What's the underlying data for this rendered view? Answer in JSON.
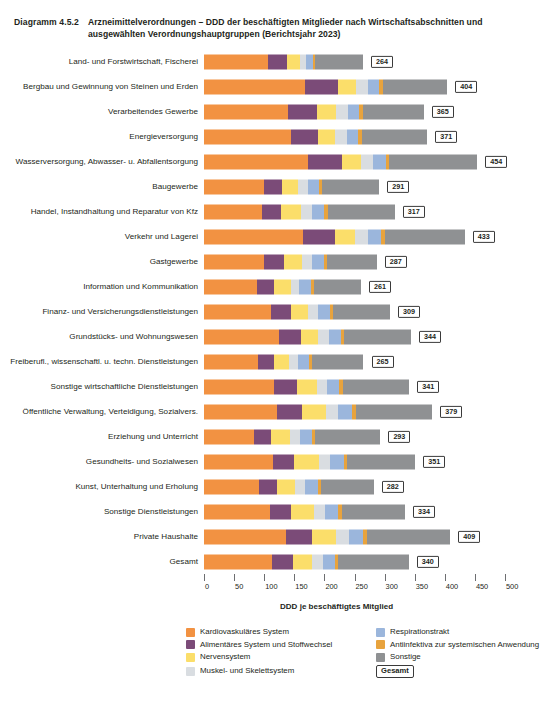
{
  "header": {
    "diagram_number": "Diagramm 4.5.2",
    "title": "Arzneimittelverordnungen – DDD der beschäftigten Mitglieder nach Wirtschaftsabschnitten und ausgewählten Verordnungshauptgruppen (Berichtsjahr 2023)"
  },
  "legend": {
    "total_label": "Gesamt"
  },
  "chart_data": {
    "type": "bar",
    "orientation": "horizontal",
    "stacked": true,
    "title": "Arzneimittelverordnungen – DDD der beschäftigten Mitglieder nach Wirtschaftsabschnitten und ausgewählten Verordnungshauptgruppen (Berichtsjahr 2023)",
    "xlabel": "DDD je beschäftigtes Mitglied",
    "ylabel": "",
    "xlim": [
      0,
      500
    ],
    "xticks": [
      0,
      50,
      100,
      150,
      200,
      250,
      300,
      350,
      400,
      450,
      500
    ],
    "grid": false,
    "legend_position": "bottom",
    "colors": {
      "Kardiovaskuläres System": "#F29242",
      "Alimentäres System und Stoffwechsel": "#7B4B78",
      "Nervensystem": "#FBDE6A",
      "Muskel- und Skelettsystem": "#D9DDE1",
      "Respirationstrakt": "#9BB6DC",
      "Antiinfektiva zur systemischen Anwendung": "#E8A33D",
      "Sonstige": "#8F9193"
    },
    "series": [
      {
        "name": "Kardiovaskuläres System",
        "color": "#F29242",
        "values": [
          106,
          168,
          140,
          145,
          172,
          100,
          96,
          165,
          100,
          88,
          111,
          124,
          89,
          117,
          122,
          83,
          114,
          92,
          110,
          137,
          113
        ]
      },
      {
        "name": "Alimentäres System und Stoffwechsel",
        "color": "#7B4B78",
        "values": [
          32,
          55,
          48,
          45,
          57,
          30,
          32,
          52,
          33,
          28,
          33,
          37,
          27,
          37,
          41,
          29,
          36,
          30,
          34,
          43,
          35
        ]
      },
      {
        "name": "Nervensystem",
        "color": "#FBDE6A",
        "values": [
          22,
          29,
          31,
          28,
          31,
          26,
          33,
          34,
          29,
          28,
          29,
          29,
          26,
          33,
          40,
          31,
          41,
          29,
          38,
          39,
          32
        ]
      },
      {
        "name": "Muskel- und Skelettsystem",
        "color": "#D9DDE1",
        "values": [
          9,
          20,
          20,
          19,
          20,
          16,
          18,
          22,
          17,
          14,
          16,
          17,
          14,
          18,
          20,
          16,
          18,
          17,
          19,
          22,
          17
        ]
      },
      {
        "name": "Respirationstrakt",
        "color": "#9BB6DC",
        "values": [
          12,
          19,
          19,
          19,
          22,
          19,
          21,
          21,
          20,
          19,
          20,
          20,
          18,
          20,
          23,
          20,
          23,
          21,
          22,
          24,
          20
        ]
      },
      {
        "name": "Antiinfektiva zur systemischen Anwendung",
        "color": "#E8A33D",
        "values": [
          4,
          6,
          6,
          6,
          6,
          5,
          6,
          6,
          5,
          5,
          5,
          6,
          5,
          6,
          6,
          5,
          6,
          5,
          6,
          6,
          5
        ]
      },
      {
        "name": "Sonstige",
        "color": "#8F9193",
        "values": [
          79,
          107,
          101,
          109,
          146,
          95,
          111,
          133,
          83,
          79,
          95,
          111,
          86,
          110,
          127,
          109,
          113,
          88,
          105,
          138,
          118
        ]
      }
    ],
    "categories": [
      {
        "label": "Land- und Forstwirtschaft, Fischerei",
        "total": 264
      },
      {
        "label": "Bergbau und Gewinnung von Steinen und Erden",
        "total": 404
      },
      {
        "label": "Verarbeitendes Gewerbe",
        "total": 365
      },
      {
        "label": "Energieversorgung",
        "total": 371
      },
      {
        "label": "Wasserversorgung, Abwasser- u. Abfallentsorgung",
        "total": 454
      },
      {
        "label": "Baugewerbe",
        "total": 291
      },
      {
        "label": "Handel, Instandhaltung und Reparatur von Kfz",
        "total": 317
      },
      {
        "label": "Verkehr und Lagerei",
        "total": 433
      },
      {
        "label": "Gastgewerbe",
        "total": 287
      },
      {
        "label": "Information und Kommunikation",
        "total": 261
      },
      {
        "label": "Finanz- und Versicherungsdienstleistungen",
        "total": 309
      },
      {
        "label": "Grundstücks- und Wohnungswesen",
        "total": 344
      },
      {
        "label": "Freiberufl., wissenschaftl. u. techn. Dienstleistungen",
        "total": 265
      },
      {
        "label": "Sonstige wirtschaftliche Dienstleistungen",
        "total": 341
      },
      {
        "label": "Öffentliche Verwaltung, Verteidigung, Sozialvers.",
        "total": 379
      },
      {
        "label": "Erziehung und Unterricht",
        "total": 293
      },
      {
        "label": "Gesundheits- und Sozialwesen",
        "total": 351
      },
      {
        "label": "Kunst, Unterhaltung und Erholung",
        "total": 282
      },
      {
        "label": "Sonstige Dienstleistungen",
        "total": 334
      },
      {
        "label": "Private Haushalte",
        "total": 409
      },
      {
        "label": "Gesamt",
        "total": 340
      }
    ]
  }
}
